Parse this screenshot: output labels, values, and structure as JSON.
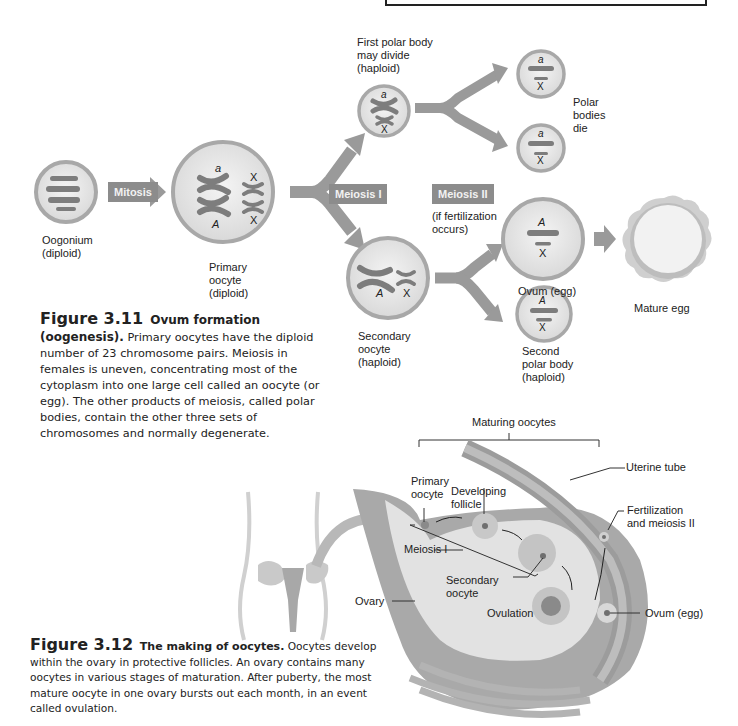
{
  "figure_3_11": {
    "number": "Figure 3.11",
    "title": "Ovum formation (oogenesis).",
    "body": "Primary oocytes have the diploid number of 23 chromosome pairs. Meiosis in females is uneven, concentrating most of the cytoplasm into one large cell called an oocyte (or egg). The other products of meiosis, called polar bodies, contain the other three sets of chromosomes and normally degenerate.",
    "steps": {
      "mitosis": "Mitosis",
      "meiosis1": "Meiosis I",
      "meiosis2": "Meiosis II",
      "meiosis2_note": "(if fertilization\noccurs)"
    },
    "labels": {
      "oogonium": "Oogonium\n(diploid)",
      "primary_oocyte": "Primary\noocyte\n(diploid)",
      "first_polar_body": "First polar body\nmay divide\n(haploid)",
      "polar_bodies_die": "Polar\nbodies\ndie",
      "secondary_oocyte": "Secondary\noocyte\n(haploid)",
      "ovum": "Ovum (egg)",
      "second_polar_body": "Second\npolar body\n(haploid)",
      "mature_egg": "Mature egg"
    },
    "chromosome_letters": {
      "a": "a",
      "A": "A",
      "X": "X"
    }
  },
  "figure_3_12": {
    "number": "Figure 3.12",
    "title": "The making of oocytes.",
    "body": "Oocytes develop within the ovary in protective follicles. An ovary contains many oocytes in various stages of maturation. After puberty, the most mature oocyte in one ovary bursts out each month, in an event called ovulation.",
    "labels": {
      "maturing_oocytes": "Maturing oocytes",
      "uterine_tube": "Uterine tube",
      "primary_oocyte": "Primary\noocyte",
      "developing_follicle": "Developing\nfollicle",
      "fertilization": "Fertilization\nand meiosis II",
      "meiosis1": "Meiosis I",
      "secondary_oocyte": "Secondary\noocyte",
      "ovary": "Ovary",
      "ovulation": "Ovulation",
      "ovum": "Ovum (egg)"
    }
  },
  "colors": {
    "cell_fill": "#e6e6e6",
    "cell_border": "#a8a8a8",
    "chromosome": "#7d7d7d",
    "arrow": "#9a9a9a",
    "step_box": "#8c8c8c"
  }
}
